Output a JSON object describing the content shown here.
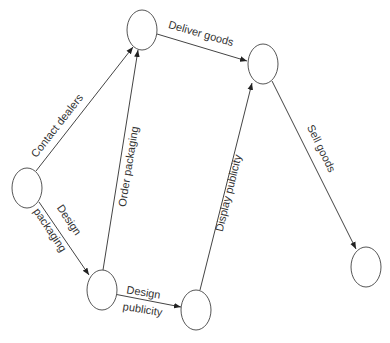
{
  "diagram": {
    "type": "activity-on-arrow network",
    "nodes": [
      {
        "id": "n1",
        "cx": 27,
        "cy": 188
      },
      {
        "id": "n2",
        "cx": 142,
        "cy": 30
      },
      {
        "id": "n3",
        "cx": 102,
        "cy": 290
      },
      {
        "id": "n4",
        "cx": 196,
        "cy": 310
      },
      {
        "id": "n5",
        "cx": 263,
        "cy": 64
      },
      {
        "id": "n6",
        "cx": 366,
        "cy": 267
      }
    ],
    "edges": [
      {
        "id": "e1",
        "from": "n1",
        "to": "n2",
        "label": "Contact dealers"
      },
      {
        "id": "e2",
        "from": "n1",
        "to": "n3",
        "label_line1": "Design",
        "label_line2": "packaging"
      },
      {
        "id": "e3",
        "from": "n3",
        "to": "n2",
        "label": "Order packaging"
      },
      {
        "id": "e4",
        "from": "n3",
        "to": "n4",
        "label_line1": "Design",
        "label_line2": "publicity"
      },
      {
        "id": "e5",
        "from": "n2",
        "to": "n5",
        "label": "Deliver goods"
      },
      {
        "id": "e6",
        "from": "n4",
        "to": "n5",
        "label": "Display publicity"
      },
      {
        "id": "e7",
        "from": "n5",
        "to": "n6",
        "label": "Sell goods"
      }
    ]
  },
  "colors": {
    "background": "#ffffff",
    "stroke": "#444444",
    "text": "#333333"
  }
}
